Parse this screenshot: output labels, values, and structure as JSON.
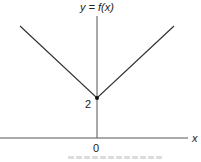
{
  "diagram": {
    "title": "y = f(x)",
    "x_axis_label": "x",
    "origin_label": "0",
    "vertex_label": "2",
    "function": "f(x) = |x| + 2 (V-shape, vertex at (0, 2))",
    "colors": {
      "line": "#333333",
      "axis": "#555555",
      "background": "#ffffff"
    }
  }
}
